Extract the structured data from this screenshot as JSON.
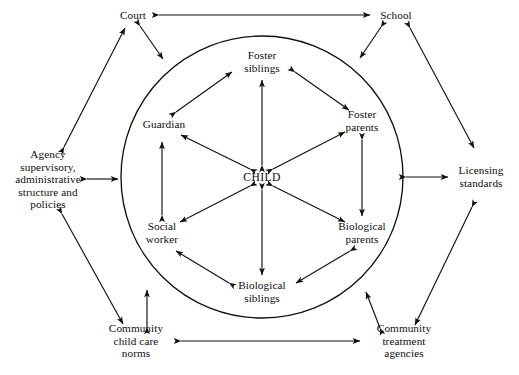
{
  "diagram": {
    "type": "ecological-systems-map",
    "background_color": "#ffffff",
    "line_color": "#111111",
    "boundary": {
      "shape": "circle",
      "name": "foster-care-system-boundary",
      "center_x": 262,
      "center_y": 177,
      "radius": 141
    },
    "center": {
      "id": "child",
      "label": "CHILD",
      "x": 262,
      "y": 177
    },
    "inner_nodes": [
      {
        "id": "foster-siblings",
        "label": "Foster\nsiblings",
        "x": 262,
        "y": 62,
        "lines": 2
      },
      {
        "id": "foster-parents",
        "label": "Foster\nparents",
        "x": 362,
        "y": 121,
        "lines": 2
      },
      {
        "id": "biological-parents",
        "label": "Biological\nparents",
        "x": 362,
        "y": 233,
        "lines": 2
      },
      {
        "id": "biological-siblings",
        "label": "Biological\nsiblings",
        "x": 262,
        "y": 292,
        "lines": 2
      },
      {
        "id": "social-worker",
        "label": "Social\nworker",
        "x": 162,
        "y": 233,
        "lines": 2
      },
      {
        "id": "guardian",
        "label": "Guardian",
        "x": 164,
        "y": 124,
        "lines": 1
      }
    ],
    "outer_nodes": [
      {
        "id": "court",
        "label": "Court",
        "x": 133,
        "y": 15,
        "lines": 1
      },
      {
        "id": "school",
        "label": "School",
        "x": 396,
        "y": 15,
        "lines": 1
      },
      {
        "id": "agency-policies",
        "label": "Agency\nsupervisory,\nadministrative\nstructure and\npolicies",
        "x": 48,
        "y": 179,
        "lines": 5
      },
      {
        "id": "licensing-standards",
        "label": "Licensing\nstandards",
        "x": 481,
        "y": 177,
        "lines": 2
      },
      {
        "id": "community-child-care",
        "label": "Community\nchild care\nnorms",
        "x": 136,
        "y": 341,
        "lines": 3
      },
      {
        "id": "community-treatment",
        "label": "Community\ntreatment\nagencies",
        "x": 404,
        "y": 341,
        "lines": 3
      }
    ],
    "connections": [
      {
        "from": "child",
        "to": "foster-siblings",
        "style": "double-arrow"
      },
      {
        "from": "child",
        "to": "foster-parents",
        "style": "double-arrow"
      },
      {
        "from": "child",
        "to": "biological-parents",
        "style": "double-arrow"
      },
      {
        "from": "child",
        "to": "biological-siblings",
        "style": "double-arrow"
      },
      {
        "from": "child",
        "to": "social-worker",
        "style": "double-arrow"
      },
      {
        "from": "child",
        "to": "guardian",
        "style": "double-arrow"
      },
      {
        "from": "guardian",
        "to": "foster-siblings",
        "style": "double-arrow"
      },
      {
        "from": "foster-siblings",
        "to": "foster-parents",
        "style": "double-arrow"
      },
      {
        "from": "foster-parents",
        "to": "biological-parents",
        "style": "double-arrow"
      },
      {
        "from": "biological-parents",
        "to": "biological-siblings",
        "style": "double-arrow"
      },
      {
        "from": "biological-siblings",
        "to": "social-worker",
        "style": "double-arrow"
      },
      {
        "from": "social-worker",
        "to": "guardian",
        "style": "double-arrow"
      },
      {
        "from": "court",
        "to": "school",
        "style": "double-arrow"
      },
      {
        "from": "community-child-care",
        "to": "community-treatment",
        "style": "double-arrow"
      },
      {
        "from": "agency-policies",
        "to": "boundary-left",
        "style": "double-arrow"
      },
      {
        "from": "licensing-standards",
        "to": "boundary-right",
        "style": "double-arrow"
      },
      {
        "from": "court",
        "to": "boundary-top-left",
        "style": "double-arrow"
      },
      {
        "from": "school",
        "to": "boundary-top-right",
        "style": "double-arrow"
      },
      {
        "from": "community-child-care",
        "to": "boundary-bottom-left",
        "style": "double-arrow"
      },
      {
        "from": "community-treatment",
        "to": "boundary-bottom-right",
        "style": "double-arrow"
      },
      {
        "from": "agency-policies",
        "to": "court",
        "style": "double-arrow"
      },
      {
        "from": "school",
        "to": "licensing-standards",
        "style": "double-arrow"
      },
      {
        "from": "agency-policies",
        "to": "community-child-care",
        "style": "double-arrow"
      },
      {
        "from": "licensing-standards",
        "to": "community-treatment",
        "style": "double-arrow"
      }
    ]
  }
}
